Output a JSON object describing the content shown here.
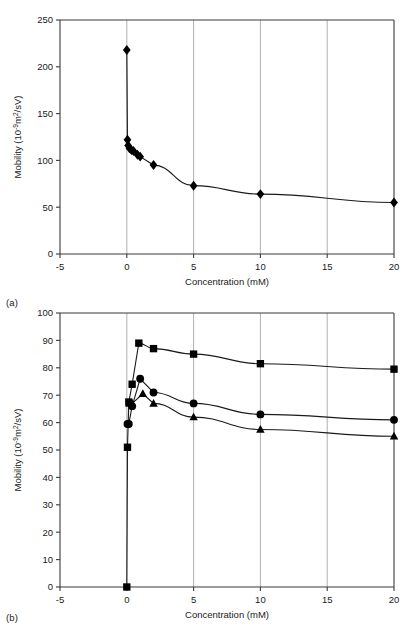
{
  "figure": {
    "panel_a_tag": "(a)",
    "panel_b_tag": "(b)"
  },
  "chart_data": [
    {
      "id": "panel-a",
      "type": "scatter",
      "title": "",
      "xlabel": "Concentration (mM)",
      "ylabel_prefix": "Mobility (10",
      "ylabel_exponent": "-9",
      "ylabel_mid": "m",
      "ylabel_sup2": "2",
      "ylabel_suffix": "/sV)",
      "ylabel_plain": "Mobility (10-9m2/sV)",
      "xlim": [
        -5,
        20
      ],
      "ylim": [
        0,
        250
      ],
      "xticks": [
        -5,
        0,
        5,
        10,
        15,
        20
      ],
      "xtick_labels": [
        "-5",
        "0",
        "5",
        "10",
        "15",
        "20"
      ],
      "yticks": [
        0,
        50,
        100,
        150,
        200,
        250
      ],
      "ytick_labels": [
        "0",
        "50",
        "100",
        "150",
        "200",
        "250"
      ],
      "grid": "vertical",
      "legend": "none",
      "series": [
        {
          "name": "mobility",
          "marker": "diamond",
          "connected": true,
          "x": [
            0,
            0.05,
            0.1,
            0.2,
            0.35,
            0.5,
            0.8,
            1.0,
            2.0,
            5.0,
            10.0,
            20.0
          ],
          "y": [
            218,
            122,
            116,
            113,
            111,
            110,
            106,
            104,
            95,
            73,
            64,
            55
          ]
        }
      ]
    },
    {
      "id": "panel-b",
      "type": "scatter",
      "title": "",
      "xlabel": "Concentration (mM)",
      "ylabel_prefix": "Mobility (10",
      "ylabel_exponent": "-9",
      "ylabel_mid": "m",
      "ylabel_sup2": "2",
      "ylabel_suffix": "/sV)",
      "ylabel_plain": "Mobility (10-9m2/sV)",
      "xlim": [
        -5,
        20
      ],
      "ylim": [
        0,
        100
      ],
      "xticks": [
        -5,
        0,
        5,
        10,
        15,
        20
      ],
      "xtick_labels": [
        "-5",
        "0",
        "5",
        "10",
        "15",
        "20"
      ],
      "yticks": [
        0,
        10,
        20,
        30,
        40,
        50,
        60,
        70,
        80,
        90,
        100
      ],
      "ytick_labels": [
        "0",
        "10",
        "20",
        "30",
        "40",
        "50",
        "60",
        "70",
        "80",
        "90",
        "100"
      ],
      "grid": "vertical",
      "legend": "none",
      "series": [
        {
          "name": "squares",
          "marker": "square",
          "connected": true,
          "x": [
            0,
            0.05,
            0.15,
            0.4,
            0.9,
            2.0,
            5.0,
            10.0,
            20.0
          ],
          "y": [
            0,
            51,
            67.5,
            74,
            89,
            87,
            85,
            81.5,
            79.5
          ]
        },
        {
          "name": "circles",
          "marker": "circle",
          "connected": true,
          "x": [
            0.05,
            0.15,
            0.4,
            1.0,
            2.0,
            5.0,
            10.0,
            20.0
          ],
          "y": [
            59.5,
            59.5,
            66,
            76,
            71,
            67,
            63,
            61
          ]
        },
        {
          "name": "triangles",
          "marker": "triangle",
          "connected": true,
          "x": [
            0.2,
            0.4,
            1.2,
            2.0,
            5.0,
            10.0,
            20.0
          ],
          "y": [
            67,
            67,
            70.5,
            67,
            62,
            57.5,
            55
          ]
        }
      ]
    }
  ]
}
